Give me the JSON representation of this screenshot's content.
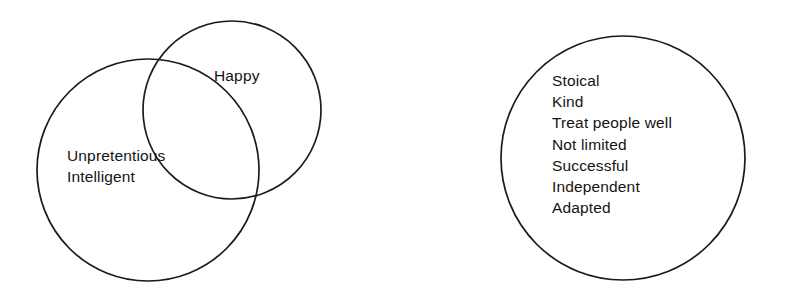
{
  "diagram": {
    "type": "venn-circles",
    "background_color": "#ffffff",
    "stroke_color": "#1a1a1a",
    "text_color": "#141414",
    "circles": [
      {
        "id": "unpretentious-intelligent-circle",
        "name": "large-left-circle",
        "cx": 148,
        "cy": 170,
        "r": 111
      },
      {
        "id": "happy-circle",
        "name": "happy-circle",
        "cx": 232,
        "cy": 110,
        "r": 89
      },
      {
        "id": "traits-circle",
        "name": "right-circle",
        "cx": 623,
        "cy": 158,
        "r": 122
      }
    ],
    "groups": {
      "happy": {
        "label": "Happy"
      },
      "left_traits": {
        "lines": [
          "Unpretentious",
          "Intelligent"
        ]
      },
      "right_traits": {
        "lines": [
          "Stoical",
          "Kind",
          "Treat people well",
          "Not limited",
          "Successful",
          "Independent",
          "Adapted"
        ]
      }
    }
  }
}
